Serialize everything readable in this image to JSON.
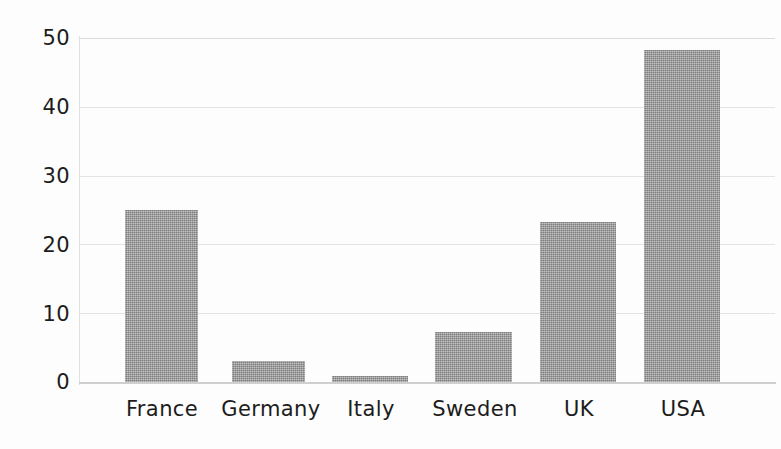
{
  "chart_data": {
    "type": "bar",
    "title": "",
    "subtitle": "",
    "xlabel": "",
    "ylabel": "",
    "categories": [
      "France",
      "Germany",
      "Italy",
      "Sweden",
      "UK",
      "USA"
    ],
    "values": [
      25,
      3.1,
      0.9,
      7.3,
      23.3,
      48.3
    ],
    "ylim": [
      0,
      50
    ],
    "yticks": [
      0,
      10,
      20,
      30,
      40,
      50
    ],
    "ytick_labels": [
      "0",
      "10",
      "20",
      "30",
      "40",
      "50"
    ],
    "grid": true,
    "grid_axis": "y",
    "legend": false,
    "bar_color": "#9a9a9a",
    "series": [
      {
        "name": "",
        "values": [
          25,
          3.1,
          0.9,
          7.3,
          23.3,
          48.3
        ]
      }
    ],
    "bars": [
      {
        "category": "France",
        "value": 25,
        "left": 125,
        "width": 73
      },
      {
        "category": "Germany",
        "value": 3.1,
        "left": 232,
        "width": 73
      },
      {
        "category": "Italy",
        "value": 0.9,
        "left": 332,
        "width": 76
      },
      {
        "category": "Sweden",
        "value": 7.3,
        "left": 435,
        "width": 77
      },
      {
        "category": "UK",
        "value": 23.3,
        "left": 540,
        "width": 76
      },
      {
        "category": "USA",
        "value": 48.3,
        "left": 644,
        "width": 76
      }
    ]
  },
  "axis": {
    "y": {
      "ticks": [
        {
          "label": "50",
          "top": 28
        },
        {
          "label": "40",
          "top": 97
        },
        {
          "label": "30",
          "top": 166
        },
        {
          "label": "20",
          "top": 235
        },
        {
          "label": "10",
          "top": 304
        },
        {
          "label": "0",
          "top": 372
        }
      ]
    },
    "x": {
      "ticks": [
        {
          "label": "France",
          "left": 103,
          "width": 118
        },
        {
          "label": "Germany",
          "left": 209,
          "width": 124
        },
        {
          "label": "Italy",
          "left": 320,
          "width": 102
        },
        {
          "label": "Sweden",
          "left": 415,
          "width": 120
        },
        {
          "label": "UK",
          "left": 542,
          "width": 74
        },
        {
          "label": "USA",
          "left": 637,
          "width": 92
        }
      ]
    }
  },
  "gridlines": [
    {
      "value": 50,
      "top": 0
    },
    {
      "value": 40,
      "top": 69
    },
    {
      "value": 30,
      "top": 138
    },
    {
      "value": 20,
      "top": 206
    },
    {
      "value": 10,
      "top": 275
    },
    {
      "value": 0,
      "top": 344
    }
  ]
}
